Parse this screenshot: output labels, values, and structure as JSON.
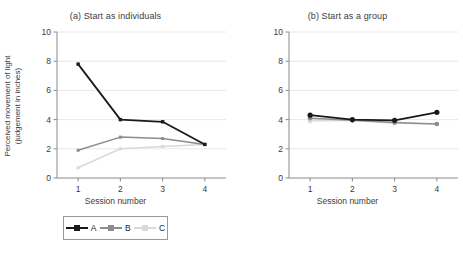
{
  "figure": {
    "ylabel_line1": "Perceived movement of light",
    "ylabel_line2": "(judgement in inches)",
    "xlabel": "Session number",
    "colors": {
      "series_a": "#1a1a1a",
      "series_b": "#8c8c8c",
      "series_c": "#d9d9d9",
      "grid": "#e8e8e8",
      "axis": "#8a8a8a",
      "text": "#3b3b3b"
    }
  },
  "panels": [
    {
      "id": "panel-a",
      "title": "(a) Start as individuals",
      "marker": "square",
      "legend": [
        {
          "label": "A",
          "color": "#1a1a1a"
        },
        {
          "label": "B",
          "color": "#8c8c8c"
        },
        {
          "label": "C",
          "color": "#d9d9d9"
        }
      ]
    },
    {
      "id": "panel-b",
      "title": "(b) Start as a group",
      "marker": "circle",
      "legend": [
        {
          "label": "A",
          "color": "#1a1a1a"
        },
        {
          "label": "B",
          "color": "#8c8c8c"
        },
        {
          "label": "C",
          "color": "#d9d9d9"
        }
      ]
    }
  ],
  "chart_data": [
    {
      "type": "line",
      "title": "(a) Start as individuals",
      "xlabel": "Session number",
      "ylabel": "Perceived movement of light (judgement in inches)",
      "categories": [
        1,
        2,
        3,
        4
      ],
      "xticklabels": [
        "1",
        "2",
        "3",
        "4"
      ],
      "yticklabels": [
        "0",
        "2",
        "4",
        "6",
        "8",
        "10"
      ],
      "xlim": [
        0.5,
        4.5
      ],
      "ylim": [
        0,
        10
      ],
      "grid": "horizontal",
      "legend_position": "below",
      "marker": "square",
      "series": [
        {
          "name": "A",
          "color": "#1a1a1a",
          "values": [
            7.8,
            4.0,
            3.85,
            2.3
          ]
        },
        {
          "name": "B",
          "color": "#8c8c8c",
          "values": [
            1.9,
            2.8,
            2.7,
            2.3
          ]
        },
        {
          "name": "C",
          "color": "#d9d9d9",
          "values": [
            0.7,
            2.0,
            2.15,
            2.3
          ]
        }
      ]
    },
    {
      "type": "line",
      "title": "(b) Start as a group",
      "xlabel": "Session number",
      "ylabel": "Perceived movement of light (judgement in inches)",
      "categories": [
        1,
        2,
        3,
        4
      ],
      "xticklabels": [
        "1",
        "2",
        "3",
        "4"
      ],
      "yticklabels": [
        "0",
        "2",
        "4",
        "6",
        "8",
        "10"
      ],
      "xlim": [
        0.5,
        4.5
      ],
      "ylim": [
        0,
        10
      ],
      "grid": "horizontal",
      "legend_position": "below",
      "marker": "circle",
      "series": [
        {
          "name": "A",
          "color": "#1a1a1a",
          "values": [
            4.3,
            4.0,
            3.95,
            4.5
          ]
        },
        {
          "name": "B",
          "color": "#8c8c8c",
          "values": [
            4.1,
            3.95,
            3.8,
            3.7
          ]
        },
        {
          "name": "C",
          "color": "#d9d9d9",
          "values": [
            3.9,
            3.95,
            3.75,
            3.7
          ]
        }
      ]
    }
  ]
}
